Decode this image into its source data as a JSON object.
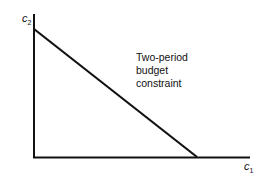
{
  "diagram": {
    "title": "Two-period budget constraint",
    "y_axis": {
      "label": "c",
      "subscript": "2"
    },
    "x_axis": {
      "label": "c",
      "subscript": "1"
    },
    "annotation": {
      "lines": [
        "Two-period",
        "budget",
        "constraint"
      ]
    },
    "colors": {
      "line": "#111111",
      "background": "#ffffff"
    }
  }
}
